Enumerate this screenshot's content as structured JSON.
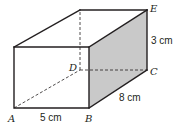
{
  "diagram": {
    "type": "cuboid",
    "colors": {
      "stroke": "#231f20",
      "shaded_face": "#c9c9c9",
      "background": "#ffffff"
    },
    "vertices": {
      "A": {
        "label": "A",
        "x": 14,
        "y": 108
      },
      "B": {
        "label": "B",
        "x": 89,
        "y": 108
      },
      "C": {
        "label": "C",
        "x": 147,
        "y": 70
      },
      "D": {
        "label": "D",
        "x": 80,
        "y": 70
      },
      "E": {
        "label": "E",
        "x": 147,
        "y": 10
      },
      "F": {
        "label": "",
        "x": 14,
        "y": 47
      },
      "G": {
        "label": "",
        "x": 89,
        "y": 47
      },
      "H": {
        "label": "",
        "x": 80,
        "y": 10
      }
    },
    "labels": {
      "A": "A",
      "B": "B",
      "C": "C",
      "D": "D",
      "E": "E"
    },
    "measurements": {
      "length_AB": "5 cm",
      "width_BC": "8 cm",
      "height_CE": "3 cm"
    }
  }
}
